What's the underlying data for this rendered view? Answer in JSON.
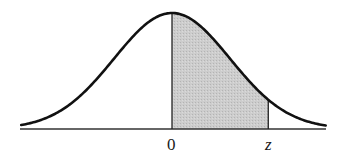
{
  "chart_data": {
    "type": "area",
    "title": "",
    "xlabel": "",
    "ylabel": "",
    "distribution": "standard normal",
    "mean": 0,
    "shaded_region": {
      "from": "0",
      "to": "z"
    },
    "x_tick_labels": [
      "0",
      "z"
    ],
    "z_value_approx": 1.66,
    "xlim": [
      -2.6,
      2.65
    ],
    "grid": false,
    "legend": null,
    "colors": {
      "curve": "#111111",
      "shade": "#c8c8c8",
      "axis": "#333333"
    }
  },
  "labels": {
    "zero": "0",
    "z": "z"
  }
}
